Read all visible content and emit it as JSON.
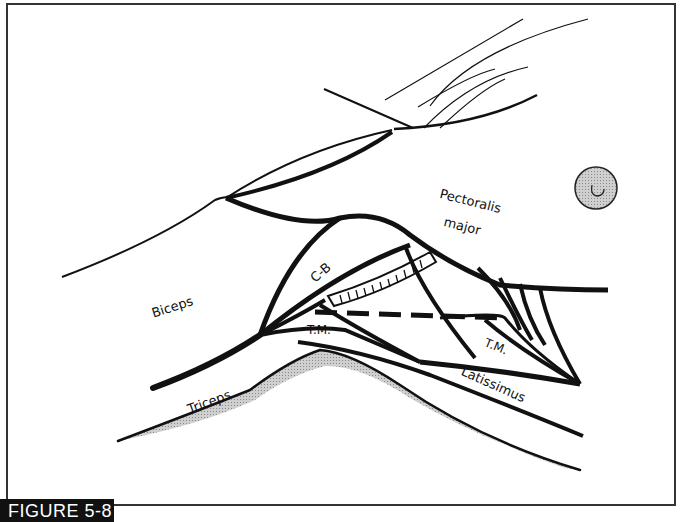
{
  "figure": {
    "caption": "FIGURE 5-8"
  },
  "labels": {
    "pectoralis_line1": "Pectoralis",
    "pectoralis_line2": "major",
    "cb": "C-B",
    "biceps": "Biceps",
    "tm_left": "T.M.",
    "tm_right": "T.M.",
    "triceps": "Triceps",
    "latissimus": "Latissimus"
  },
  "colors": {
    "ink": "#111111",
    "shade": "#b5b5b5",
    "nipple_fill": "#bdbdbd"
  }
}
